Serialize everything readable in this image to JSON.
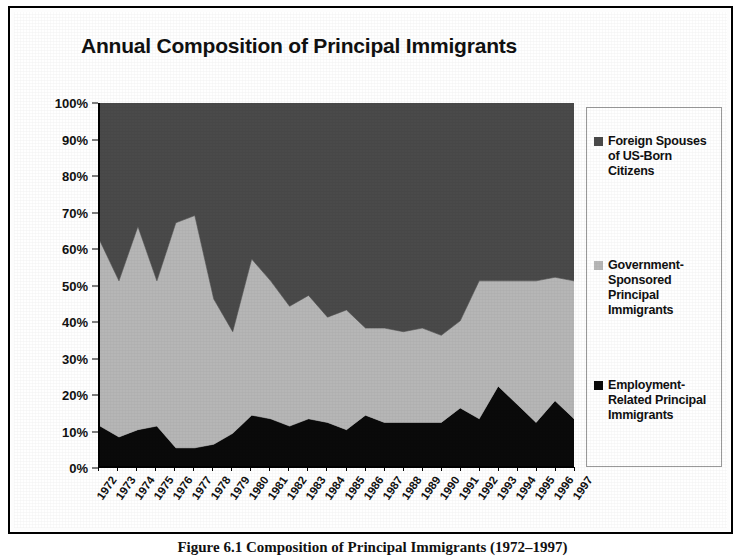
{
  "chart_data": {
    "type": "area",
    "title": "Annual Composition of Principal Immigrants",
    "xlabel": "",
    "ylabel": "",
    "ylim": [
      0,
      100
    ],
    "stacked": true,
    "normalized_percent": true,
    "grid": false,
    "legend_position": "right",
    "categories": [
      "1972",
      "1973",
      "1974",
      "1975",
      "1976",
      "1977",
      "1978",
      "1979",
      "1980",
      "1981",
      "1982",
      "1983",
      "1984",
      "1985",
      "1986",
      "1987",
      "1988",
      "1989",
      "1990",
      "1991",
      "1992",
      "1993",
      "1994",
      "1995",
      "1996",
      "1997"
    ],
    "ytick_labels": [
      "0%",
      "10%",
      "20%",
      "30%",
      "40%",
      "50%",
      "60%",
      "70%",
      "80%",
      "90%",
      "100%"
    ],
    "ytick_values": [
      0,
      10,
      20,
      30,
      40,
      50,
      60,
      70,
      80,
      90,
      100
    ],
    "series": [
      {
        "name": "Employment-Related Principal Immigrants",
        "color": "#0a0a0a",
        "values": [
          11,
          8,
          10,
          11,
          5,
          5,
          6,
          9,
          14,
          13,
          11,
          13,
          12,
          10,
          14,
          12,
          12,
          12,
          12,
          16,
          13,
          22,
          17,
          12,
          18,
          13
        ]
      },
      {
        "name": "Government-Sponsored Principal Immigrants",
        "color": "#b6b6b6",
        "values": [
          51,
          43,
          56,
          40,
          62,
          64,
          40,
          28,
          43,
          38,
          33,
          34,
          29,
          33,
          24,
          26,
          25,
          26,
          24,
          24,
          38,
          29,
          34,
          39,
          34,
          38
        ]
      },
      {
        "name": "Foreign Spouses of US-Born Citizens",
        "color": "#4a4a4a",
        "values": [
          38,
          49,
          34,
          49,
          33,
          31,
          54,
          63,
          43,
          49,
          56,
          53,
          59,
          57,
          62,
          62,
          63,
          62,
          64,
          60,
          49,
          49,
          49,
          49,
          48,
          49
        ]
      }
    ],
    "cumulative_upper_bounds": {
      "employment_top": [
        11,
        8,
        10,
        11,
        5,
        5,
        6,
        9,
        14,
        13,
        11,
        13,
        12,
        10,
        14,
        12,
        12,
        12,
        12,
        16,
        13,
        22,
        17,
        12,
        18,
        13
      ],
      "government_top": [
        62,
        51,
        66,
        51,
        67,
        69,
        46,
        37,
        57,
        51,
        44,
        47,
        41,
        43,
        38,
        38,
        37,
        38,
        36,
        40,
        51,
        51,
        51,
        51,
        52,
        51
      ]
    }
  },
  "legend": {
    "entries": [
      {
        "label": "Foreign Spouses of US-Born Citizens",
        "color": "#4a4a4a"
      },
      {
        "label": "Government-Sponsored Principal Immigrants",
        "color": "#b6b6b6"
      },
      {
        "label": "Employment-Related Principal Immigrants",
        "color": "#0a0a0a"
      }
    ]
  },
  "caption": {
    "text": "Figure 6.1 Composition of Principal Immigrants (1972–1997)"
  }
}
